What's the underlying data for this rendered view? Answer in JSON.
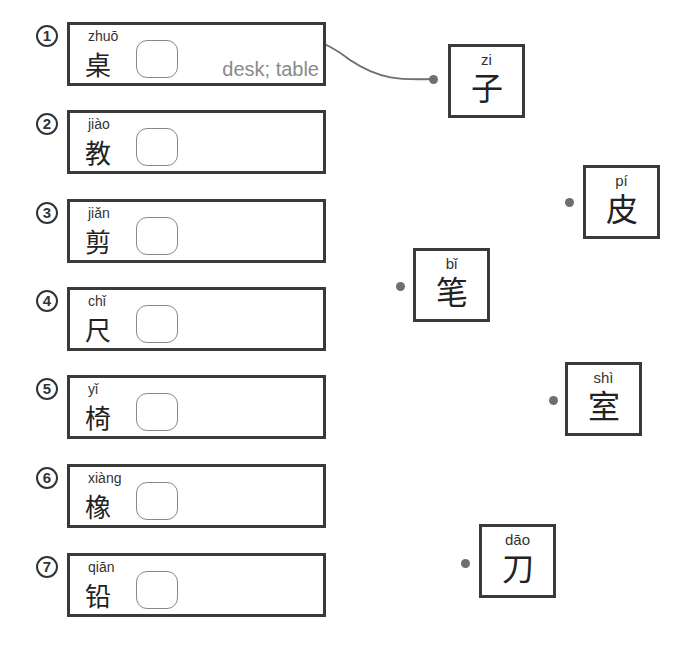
{
  "exercise": {
    "words": [
      {
        "number": "1",
        "pinyin": "zhuō",
        "hanzi": "桌",
        "meaning": "desk; table",
        "top": 22
      },
      {
        "number": "2",
        "pinyin": "jiào",
        "hanzi": "教",
        "meaning": "",
        "top": 110
      },
      {
        "number": "3",
        "pinyin": "jiǎn",
        "hanzi": "剪",
        "meaning": "",
        "top": 199
      },
      {
        "number": "4",
        "pinyin": "chǐ",
        "hanzi": "尺",
        "meaning": "",
        "top": 287
      },
      {
        "number": "5",
        "pinyin": "yǐ",
        "hanzi": "椅",
        "meaning": "",
        "top": 375
      },
      {
        "number": "6",
        "pinyin": "xiàng",
        "hanzi": "橡",
        "meaning": "",
        "top": 464
      },
      {
        "number": "7",
        "pinyin": "qiān",
        "hanzi": "铅",
        "meaning": "",
        "top": 553
      }
    ],
    "cards": [
      {
        "pinyin": "zi",
        "hanzi": "子",
        "left": 448,
        "top": 44
      },
      {
        "pinyin": "pí",
        "hanzi": "皮",
        "left": 583,
        "top": 165
      },
      {
        "pinyin": "bǐ",
        "hanzi": "笔",
        "left": 413,
        "top": 248
      },
      {
        "pinyin": "shì",
        "hanzi": "室",
        "left": 565,
        "top": 362
      },
      {
        "pinyin": "dāo",
        "hanzi": "刀",
        "left": 479,
        "top": 524
      }
    ],
    "connection": {
      "from_word": "1",
      "to_card": "zi"
    },
    "colors": {
      "border": "#3a3a3a",
      "line": "#6f6f6f",
      "meaning_text": "#8a8a8a"
    }
  }
}
